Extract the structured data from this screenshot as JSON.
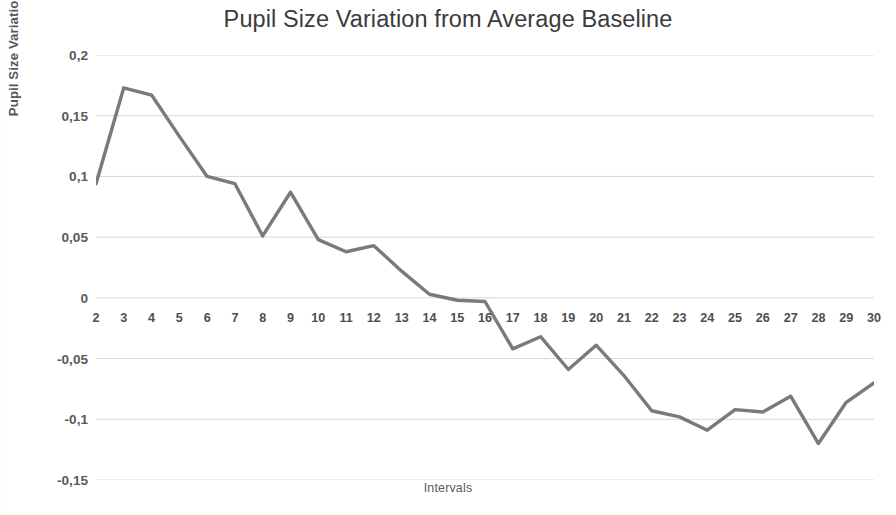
{
  "chart_data": {
    "type": "line",
    "title": "Pupil Size Variation from Average Baseline",
    "xlabel": "Intervals",
    "ylabel": "Pupil Size Variation from Baseline (mm)",
    "x": [
      2,
      3,
      4,
      5,
      6,
      7,
      8,
      9,
      10,
      11,
      12,
      13,
      14,
      15,
      16,
      17,
      18,
      19,
      20,
      21,
      22,
      23,
      24,
      25,
      26,
      27,
      28,
      29,
      30
    ],
    "values": [
      0.094,
      0.173,
      0.167,
      0.133,
      0.1,
      0.094,
      0.051,
      0.087,
      0.048,
      0.038,
      0.043,
      0.022,
      0.003,
      -0.002,
      -0.003,
      -0.042,
      -0.032,
      -0.059,
      -0.039,
      -0.064,
      -0.093,
      -0.098,
      -0.109,
      -0.092,
      -0.094,
      -0.081,
      -0.12,
      -0.086,
      -0.07
    ],
    "xtick_labels": [
      "2",
      "3",
      "4",
      "5",
      "6",
      "7",
      "8",
      "9",
      "10",
      "11",
      "12",
      "13",
      "14",
      "15",
      "16",
      "17",
      "18",
      "19",
      "20",
      "21",
      "22",
      "23",
      "24",
      "25",
      "26",
      "27",
      "28",
      "29",
      "30"
    ],
    "ytick_values": [
      0.2,
      0.15,
      0.1,
      0.05,
      0,
      -0.05,
      -0.1,
      -0.15
    ],
    "ytick_labels": [
      "0,2",
      "0,15",
      "0,1",
      "0,05",
      "0",
      "-0,05",
      "-0,1",
      "-0,15"
    ],
    "xlim": [
      2,
      30
    ],
    "ylim": [
      -0.15,
      0.2
    ],
    "grid": true,
    "grid_axis": "y",
    "legend": false,
    "series_color": "#6f6f6f",
    "grid_color": "#d8d8d8",
    "text_color": "#4e4e4e",
    "background_color": "#ffffff"
  }
}
